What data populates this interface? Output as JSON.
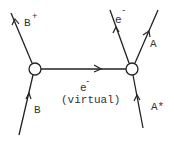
{
  "diagram": {
    "type": "feynman-diagram",
    "vertices": [
      {
        "id": "left-vertex",
        "x": 35,
        "y": 69
      },
      {
        "id": "right-vertex",
        "x": 132,
        "y": 69
      }
    ],
    "particles": {
      "b_plus": {
        "label": "B",
        "sup": "+"
      },
      "b_in": {
        "label": "B"
      },
      "e_virtual": {
        "label": "e",
        "sup": "-",
        "note": "(virtual)"
      },
      "e_out": {
        "label": "e",
        "sup": "-"
      },
      "a_out": {
        "label": "A"
      },
      "a_star_in": {
        "label": "A*"
      }
    }
  }
}
